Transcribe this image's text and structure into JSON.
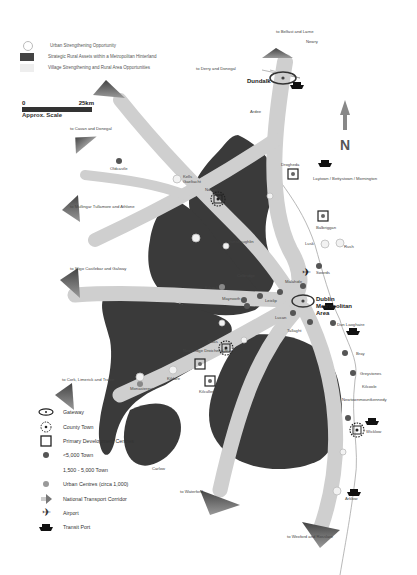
{
  "legend_top": {
    "items": [
      {
        "label": "Urban Strengthening Opportunity",
        "symbol": "open-circle"
      },
      {
        "label": "Strategic Rural Assets within a Metropolitan Hinterland",
        "symbol": "dark-rect"
      },
      {
        "label": "Village Strengthening and Rural Area Opportunities",
        "symbol": "light-rect"
      }
    ]
  },
  "scale": {
    "start": "0",
    "end": "25km",
    "caption": "Approx. Scale"
  },
  "north_arrow": {
    "label": "N"
  },
  "legend_bottom": {
    "items": [
      {
        "label": "Gateway",
        "symbol": "gateway-icon"
      },
      {
        "label": "County Town",
        "symbol": "county-town-icon"
      },
      {
        "label": "Primary Development Centres",
        "symbol": "square-icon"
      },
      {
        "label": "<5,000 Town",
        "symbol": "dark-dot-icon"
      },
      {
        "label": "1,500 - 5,000 Town",
        "symbol": "none"
      },
      {
        "label": "Urban Centres (circa 1,000)",
        "symbol": "grey-dot-icon"
      },
      {
        "label": "National Transport Corridor",
        "symbol": "arrow-icon"
      },
      {
        "label": "Airport",
        "symbol": "airplane-icon"
      },
      {
        "label": "Transit Port",
        "symbol": "ship-icon"
      }
    ]
  },
  "corridors": [
    {
      "label": "to Belfast and Larne"
    },
    {
      "label": "to Derry and Donegal"
    },
    {
      "label": "to Cavan and Donegal"
    },
    {
      "label": "to Mullingar Tullamore and Athlone"
    },
    {
      "label": "to Sligo Castlebar and Galway"
    },
    {
      "label": "to Cork, Limerick and Tralee"
    },
    {
      "label": "to Waterford"
    },
    {
      "label": "to Wexford and Rosslare"
    }
  ],
  "places": {
    "newry": "Newry",
    "dundalk": "Dundalk",
    "ardee": "Ardee",
    "oldcastle": "Oldcastle",
    "kells": "Kells",
    "gaeltacht": "Gaeltacht",
    "navan": "Navan",
    "drogheda": "Drogheda",
    "laytown": "Laytown / Bettystown / Mornington",
    "balbriggan": "Balbriggan",
    "lusk": "Lusk",
    "rush": "Rush",
    "dunshaughlin": "Dunshaughlin",
    "swords": "Swords",
    "malahide": "Malahide",
    "dublin": "Dublin Metropolitan Area",
    "celbridge": "Celbridge",
    "leixlip": "Leixlip",
    "maynooth": "Maynooth",
    "kilcock": "Kilcock",
    "lucan": "Lucan",
    "tallaght": "Tallaght",
    "dun_laoghaire": "Dun Laoghaire",
    "bray": "Bray",
    "greystones": "Greystones",
    "kilcoole": "Kilcoole",
    "newtown": "Newtownmountkennedy",
    "wicklow": "Wicklow",
    "arklow": "Arklow",
    "naas": "Naas",
    "newbridge": "Newbridge Droichead Nua",
    "kildare": "Kildare",
    "kilcullen": "Kilcullen",
    "monasterevin": "Monasterevin",
    "carlow": "Carlow"
  },
  "colors": {
    "dark_area": "#3a3a3a",
    "corridor": "#c8c8c8",
    "light_area": "#e6e6e6",
    "arrow_head": "#555555"
  }
}
